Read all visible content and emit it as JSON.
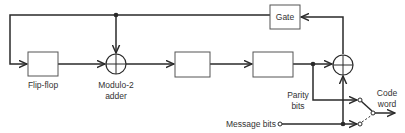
{
  "diagram": {
    "type": "block-diagram",
    "title": "",
    "blocks": [
      {
        "id": "flip-flop",
        "label": "Flip-flop"
      },
      {
        "id": "register-2",
        "label": ""
      },
      {
        "id": "register-3",
        "label": ""
      },
      {
        "id": "gate",
        "label": "Gate"
      }
    ],
    "adders": [
      {
        "id": "adder-1",
        "label_line1": "Modulo-2",
        "label_line2": "adder"
      },
      {
        "id": "adder-2",
        "label_line1": "",
        "label_line2": ""
      }
    ],
    "labels": {
      "flip_flop": "Flip-flop",
      "adder_line1": "Modulo-2",
      "adder_line2": "adder",
      "gate": "Gate",
      "parity_line1": "Parity",
      "parity_line2": "bits",
      "message_bits": "Message bits",
      "code_line1": "Code",
      "code_line2": "word"
    },
    "colors": {
      "line": "#2a2a2a",
      "box_stroke": "#555555",
      "text": "#333333",
      "background": "#ffffff"
    }
  }
}
